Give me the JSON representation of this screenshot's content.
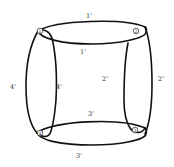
{
  "diagram": {
    "edge_labels": {
      "top_outer": "1'",
      "top_inner": "1'",
      "right_outer": "2'",
      "right_inner": "2'",
      "bottom_inner": "3'",
      "bottom_outer": "3'",
      "left_outer": "4'",
      "left_inner": "4'"
    },
    "corners": {
      "top_left": "1",
      "top_right": "2",
      "bottom_left": "4",
      "bottom_right": "3"
    },
    "colors": {
      "stroke": "#111111",
      "background": "#ffffff"
    }
  }
}
